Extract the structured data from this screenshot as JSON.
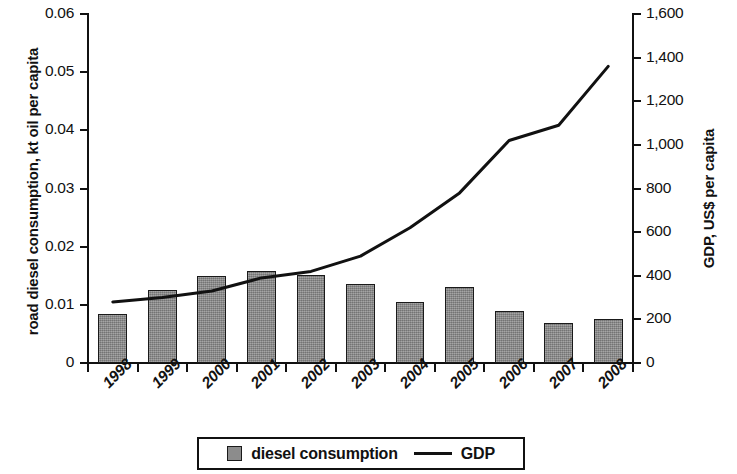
{
  "chart_data": {
    "type": "bar",
    "title": "",
    "subtitle": "",
    "xlabel": "",
    "categories": [
      "1998",
      "1999",
      "2000",
      "2001",
      "2002",
      "2003",
      "2004",
      "2005",
      "2006",
      "2007",
      "2008"
    ],
    "grid": false,
    "legend_position": "bottom-center",
    "axes": {
      "left": {
        "label": "road diesel consumption, kt oil per capita",
        "ylim": [
          0,
          0.06
        ],
        "ticks": [
          0,
          0.01,
          0.02,
          0.03,
          0.04,
          0.05,
          0.06
        ],
        "tick_labels": [
          "0",
          "0.01",
          "0.02",
          "0.03",
          "0.04",
          "0.05",
          "0.06"
        ]
      },
      "right": {
        "label": "GDP, US$ per capita",
        "ylim": [
          0,
          1600
        ],
        "ticks": [
          0,
          200,
          400,
          600,
          800,
          1000,
          1200,
          1400,
          1600
        ],
        "tick_labels": [
          "0",
          "200",
          "400",
          "600",
          "800",
          "1,000",
          "1,200",
          "1,400",
          "1,600"
        ]
      }
    },
    "series": [
      {
        "name": "diesel consumption",
        "type": "bar",
        "axis": "left",
        "color": "#8c8c8c",
        "edge_color": "#1a1a1a",
        "values": [
          0.0085,
          0.0125,
          0.015,
          0.0158,
          0.0151,
          0.0135,
          0.0105,
          0.0131,
          0.0089,
          0.0069,
          0.0076
        ]
      },
      {
        "name": "GDP",
        "type": "line",
        "axis": "right",
        "color": "#111111",
        "values": [
          280,
          300,
          330,
          390,
          420,
          490,
          620,
          780,
          1020,
          1090,
          1360
        ]
      }
    ]
  },
  "legend": {
    "items": [
      {
        "label": "diesel consumption",
        "marker": "gray-square-swatch"
      },
      {
        "label": "GDP",
        "marker": "black-line-swatch"
      }
    ]
  }
}
